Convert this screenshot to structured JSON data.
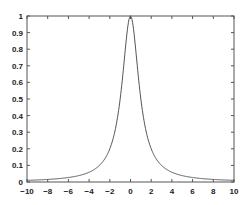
{
  "chart_data": {
    "type": "line",
    "title": "",
    "xlabel": "",
    "ylabel": "",
    "xlim": [
      -10,
      10
    ],
    "ylim": [
      0,
      1
    ],
    "grid": false,
    "legend": null,
    "xticks": [
      -10,
      -8,
      -6,
      -4,
      -2,
      0,
      2,
      4,
      6,
      8,
      10
    ],
    "yticks": [
      0,
      0.1,
      0.2,
      0.3,
      0.4,
      0.5,
      0.6,
      0.7,
      0.8,
      0.9,
      1
    ],
    "xtick_labels": [
      "-10",
      "-8",
      "-6",
      "-4",
      "-2",
      "0",
      "2",
      "4",
      "6",
      "8",
      "10"
    ],
    "ytick_labels": [
      "0",
      "0.1",
      "0.2",
      "0.3",
      "0.4",
      "0.5",
      "0.6",
      "0.7",
      "0.8",
      "0.9",
      "1"
    ],
    "series": [
      {
        "name": "curve",
        "color": "#555555",
        "function": "1/(1+x^2)",
        "x": [
          -10,
          -8,
          -6,
          -4,
          -3,
          -2,
          -1.5,
          -1,
          -0.5,
          0,
          0.5,
          1,
          1.5,
          2,
          3,
          4,
          6,
          8,
          10
        ],
        "y": [
          0.0099,
          0.0154,
          0.027,
          0.0588,
          0.1,
          0.2,
          0.3077,
          0.5,
          0.8,
          1.0,
          0.8,
          0.5,
          0.3077,
          0.2,
          0.1,
          0.0588,
          0.027,
          0.0154,
          0.0099
        ]
      }
    ]
  },
  "plot": {
    "axis_color": "#555555",
    "line_color": "#555555"
  }
}
